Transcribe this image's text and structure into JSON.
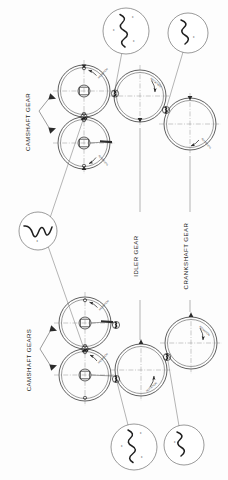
{
  "figure": {
    "orientation": "rotated-90-ccw",
    "background_color": "#fdfdfd",
    "ink_color": "#2b2b2b"
  },
  "labels": {
    "camshaft_gear": "CAMSHAFT GEAR",
    "camshaft_gears": "CAMSHAFT GEARS",
    "idler_gear": "IDLER GEAR",
    "crankshaft_gear": "CRANKSHAFT GEAR"
  },
  "gears": [
    {
      "id": "upper-camshaft-gear-a",
      "name": "CAMSHAFT GEAR",
      "cx": 84,
      "cy": 91,
      "r": 26,
      "bore_r": 6,
      "rotation_note": "ROTATION",
      "rotation_dir": "cw"
    },
    {
      "id": "upper-camshaft-gear-b",
      "name": "CAMSHAFT GEAR",
      "cx": 84,
      "cy": 143,
      "r": 26,
      "bore_r": 6,
      "rotation_note": "ROTATION",
      "rotation_dir": "ccw"
    },
    {
      "id": "upper-idler-gear",
      "name": "IDLER GEAR",
      "cx": 140,
      "cy": 96,
      "r": 26,
      "bore_r": 0,
      "rotation_note": "ROTATION",
      "rotation_dir": "cw"
    },
    {
      "id": "upper-crankshaft-gear",
      "name": "CRANKSHAFT GEAR",
      "cx": 190,
      "cy": 124,
      "r": 26,
      "bore_r": 0,
      "rotation_note": "ROTATION",
      "rotation_dir": "ccw"
    },
    {
      "id": "lower-camshaft-gear-a",
      "name": "CAMSHAFT GEAR",
      "cx": 85,
      "cy": 323,
      "r": 26,
      "bore_r": 6,
      "rotation_note": "ROTATION",
      "rotation_dir": "cw"
    },
    {
      "id": "lower-camshaft-gear-b",
      "name": "CAMSHAFT GEAR",
      "cx": 85,
      "cy": 375,
      "r": 26,
      "bore_r": 6,
      "rotation_note": "ROTATION",
      "rotation_dir": "ccw"
    },
    {
      "id": "lower-idler-gear",
      "name": "IDLER GEAR",
      "cx": 141,
      "cy": 370,
      "r": 26,
      "bore_r": 0,
      "rotation_note": "ROTATION",
      "rotation_dir": "ccw"
    },
    {
      "id": "lower-crankshaft-gear",
      "name": "CRANKSHAFT GEAR",
      "cx": 191,
      "cy": 343,
      "r": 26,
      "bore_r": 0,
      "rotation_note": "ROTATION",
      "rotation_dir": "cw"
    }
  ],
  "detail_bubbles": [
    {
      "id": "detail-upper-cam-to-idler",
      "cx": 126,
      "cy": 31,
      "r": 23,
      "description": "meshing gear teeth with timing marks",
      "marks": [
        "x",
        "x",
        "x"
      ]
    },
    {
      "id": "detail-upper-idler-to-crank",
      "cx": 188,
      "cy": 33,
      "r": 20,
      "description": "meshing gear teeth with timing marks",
      "marks": [
        "x"
      ]
    },
    {
      "id": "detail-upper-cam-to-cam",
      "cx": 38,
      "cy": 231,
      "r": 19,
      "description": "camshaft gear to camshaft gear timing marks",
      "marks": [
        "x"
      ]
    },
    {
      "id": "detail-lower-cam-to-idler",
      "cx": 134,
      "cy": 447,
      "r": 23,
      "description": "meshing gear teeth with timing marks",
      "marks": [
        "x",
        "x",
        "x"
      ]
    },
    {
      "id": "detail-lower-idler-to-crank",
      "cx": 184,
      "cy": 445,
      "r": 20,
      "description": "meshing gear teeth with timing marks",
      "marks": [
        "x"
      ]
    }
  ],
  "annotations": {
    "rotation": "ROTATION",
    "timing_mark": "x"
  }
}
